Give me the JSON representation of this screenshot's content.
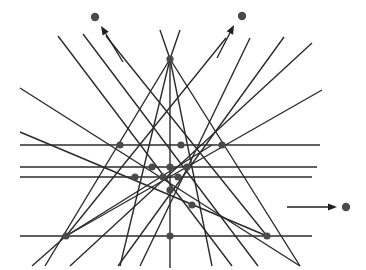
{
  "figure": {
    "width": 366,
    "height": 270,
    "background_color": "#ffffff",
    "line_color": "#2b2b2b",
    "node_color": "#4a4a4a",
    "dot_color": "#4a4a4a",
    "arrow_color": "#1f1f1f",
    "line_width": 1.4,
    "node_radius": 3.6,
    "dot_radius": 4.2
  },
  "lines": [
    {
      "name": "horizontal-line-1",
      "x1": 20,
      "y1": 145,
      "x2": 320,
      "y2": 145
    },
    {
      "name": "horizontal-line-2",
      "x1": 20,
      "y1": 167,
      "x2": 317,
      "y2": 167
    },
    {
      "name": "horizontal-line-3",
      "x1": 20,
      "y1": 177,
      "x2": 312,
      "y2": 177
    },
    {
      "name": "horizontal-line-4-base",
      "x1": 20,
      "y1": 236,
      "x2": 312,
      "y2": 236
    },
    {
      "name": "vertical-line-center",
      "x1": 170,
      "y1": 59,
      "x2": 170,
      "y2": 268
    },
    {
      "name": "apex-to-bottom-left",
      "x1": 170,
      "y1": 59,
      "x2": 45,
      "y2": 266
    },
    {
      "name": "apex-to-bottom-right",
      "x1": 170,
      "y1": 59,
      "x2": 300,
      "y2": 266
    },
    {
      "name": "apex-left-steep",
      "x1": 170,
      "y1": 59,
      "x2": 120,
      "y2": 266
    },
    {
      "name": "apex-right-steep",
      "x1": 170,
      "y1": 59,
      "x2": 212,
      "y2": 266
    },
    {
      "name": "apex-left-upper-ray",
      "x1": 170,
      "y1": 59,
      "x2": 160,
      "y2": 30
    },
    {
      "name": "apex-right-upper-ray",
      "x1": 170,
      "y1": 59,
      "x2": 180,
      "y2": 30
    },
    {
      "name": "diag-down-right-from-upper-left-a",
      "x1": 58,
      "y1": 36,
      "x2": 232,
      "y2": 266
    },
    {
      "name": "diag-down-right-from-upper-left-b",
      "x1": 83,
      "y1": 34,
      "x2": 258,
      "y2": 266
    },
    {
      "name": "diag-down-right-from-upper-left-c",
      "x1": 106,
      "y1": 36,
      "x2": 267,
      "y2": 236
    },
    {
      "name": "diag-down-left-from-upper-right-a",
      "x1": 284,
      "y1": 37,
      "x2": 118,
      "y2": 266
    },
    {
      "name": "diag-down-left-from-upper-right-b",
      "x1": 250,
      "y1": 38,
      "x2": 140,
      "y2": 266
    },
    {
      "name": "diag-down-left-from-upper-right-c",
      "x1": 226,
      "y1": 38,
      "x2": 66,
      "y2": 236
    },
    {
      "name": "diag-shallow-left-to-right-a",
      "x1": 20,
      "y1": 88,
      "x2": 300,
      "y2": 266
    },
    {
      "name": "diag-shallow-left-to-right-b",
      "x1": 20,
      "y1": 132,
      "x2": 267,
      "y2": 236
    },
    {
      "name": "diag-shallow-right-to-left-a",
      "x1": 322,
      "y1": 90,
      "x2": 66,
      "y2": 236
    },
    {
      "name": "diag-shallow-right-to-left-b",
      "x1": 312,
      "y1": 43,
      "x2": 70,
      "y2": 266
    },
    {
      "name": "diag-bottom-left-fan-a",
      "x1": 66,
      "y1": 236,
      "x2": 32,
      "y2": 266
    },
    {
      "name": "diag-bottom-left-fan-b",
      "x1": 66,
      "y1": 236,
      "x2": 212,
      "y2": 145
    }
  ],
  "nodes": [
    {
      "name": "node-apex-top",
      "x": 170,
      "y": 59
    },
    {
      "name": "node-left-upper",
      "x": 120,
      "y": 145
    },
    {
      "name": "node-center-upper",
      "x": 181,
      "y": 145
    },
    {
      "name": "node-right-upper",
      "x": 222,
      "y": 145
    },
    {
      "name": "node-mid-a",
      "x": 152,
      "y": 167
    },
    {
      "name": "node-mid-b",
      "x": 170,
      "y": 167
    },
    {
      "name": "node-mid-c",
      "x": 187,
      "y": 167
    },
    {
      "name": "node-mid-d",
      "x": 135,
      "y": 177
    },
    {
      "name": "node-mid-e",
      "x": 163,
      "y": 177
    },
    {
      "name": "node-mid-f",
      "x": 178,
      "y": 177
    },
    {
      "name": "node-lower-center",
      "x": 170,
      "y": 190
    },
    {
      "name": "node-lower-right",
      "x": 192,
      "y": 205
    },
    {
      "name": "node-bottom-left",
      "x": 66,
      "y": 236
    },
    {
      "name": "node-bottom-center",
      "x": 170,
      "y": 236
    },
    {
      "name": "node-bottom-right",
      "x": 267,
      "y": 236
    }
  ],
  "markers": [
    {
      "name": "marker-top-left",
      "dot": {
        "x": 95,
        "y": 17
      },
      "arrow": {
        "x1": 123,
        "y1": 62,
        "x2": 101,
        "y2": 26
      }
    },
    {
      "name": "marker-top-right",
      "dot": {
        "x": 242,
        "y": 16
      },
      "arrow": {
        "x1": 217,
        "y1": 58,
        "x2": 234,
        "y2": 25
      }
    },
    {
      "name": "marker-right",
      "dot": {
        "x": 346,
        "y": 207
      },
      "arrow": {
        "x1": 287,
        "y1": 207,
        "x2": 337,
        "y2": 207
      }
    }
  ]
}
